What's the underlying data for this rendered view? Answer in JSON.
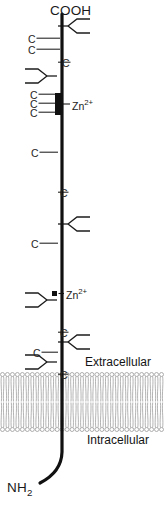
{
  "diagram": {
    "termini": {
      "c_terminus": "COOH",
      "n_terminus_text": "NH",
      "n_terminus_sub": "2"
    },
    "compartments": {
      "outside_label": "Extracellular",
      "inside_label": "Intracellular"
    },
    "ion_label": {
      "element": "Zn",
      "charge": "2+"
    },
    "cysteine_label": "C",
    "colors": {
      "backbone": "#111111",
      "text": "#1a1a1a",
      "membrane": "#9a9a9a",
      "marker": "#101010",
      "background": "#ffffff"
    },
    "cysteines": [
      {
        "id": "c1",
        "x": 28,
        "y": 34,
        "tick_to": 60
      },
      {
        "id": "c2",
        "x": 28,
        "y": 45,
        "tick_to": 60
      },
      {
        "id": "c3",
        "x": 62,
        "y": 58,
        "tick_to": 58
      },
      {
        "id": "c4",
        "x": 30,
        "y": 90,
        "tick_to": 60
      },
      {
        "id": "c5",
        "x": 30,
        "y": 99,
        "tick_to": 60
      },
      {
        "id": "c6",
        "x": 30,
        "y": 108,
        "tick_to": 60
      },
      {
        "id": "c7",
        "x": 31,
        "y": 148,
        "tick_to": 58
      },
      {
        "id": "c8",
        "x": 60,
        "y": 188,
        "tick_to": 58
      },
      {
        "id": "c9",
        "x": 31,
        "y": 239,
        "tick_to": 58
      },
      {
        "id": "c10",
        "x": 60,
        "y": 328,
        "tick_to": 58
      },
      {
        "id": "c11",
        "x": 33,
        "y": 348,
        "tick_to": 58
      },
      {
        "id": "c12",
        "x": 60,
        "y": 370,
        "tick_to": 58
      }
    ],
    "glycans": [
      {
        "id": "glycan-1",
        "side": "right",
        "x": 58,
        "y": 26
      },
      {
        "id": "glycan-2",
        "side": "left",
        "x": 57,
        "y": 76
      },
      {
        "id": "glycan-3",
        "side": "right",
        "x": 58,
        "y": 224
      },
      {
        "id": "glycan-4",
        "side": "left",
        "x": 57,
        "y": 300
      },
      {
        "id": "glycan-5",
        "side": "right",
        "x": 58,
        "y": 342
      },
      {
        "id": "glycan-6",
        "side": "left",
        "x": 57,
        "y": 362
      }
    ],
    "zinc_sites": [
      {
        "id": "zinc-site-upper",
        "marker_x": 55,
        "marker_y": 93,
        "marker_w": 6,
        "marker_h": 22,
        "label_x": 72,
        "label_y": 99
      },
      {
        "id": "zinc-site-lower",
        "marker_x": 52,
        "marker_y": 291,
        "marker_w": 5,
        "marker_h": 5,
        "label_x": 66,
        "label_y": 288
      }
    ],
    "membrane": {
      "top": 372,
      "bottom": 432,
      "leaflet_count": 2,
      "lipid_count": 33
    },
    "labels": {
      "cooh_x": 50,
      "cooh_y": 4,
      "nh2_x": 7,
      "nh2_y": 481,
      "extracellular_x": 85,
      "extracellular_y": 356,
      "intracellular_x": 87,
      "intracellular_y": 434
    }
  }
}
